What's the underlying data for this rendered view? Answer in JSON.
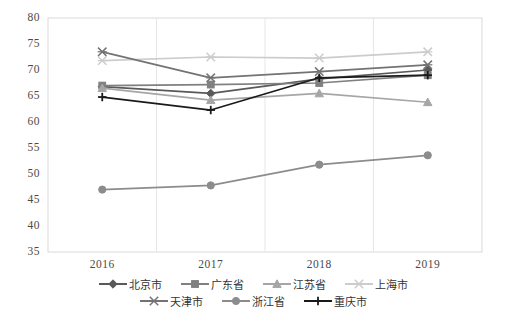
{
  "chart_data": {
    "type": "line",
    "title": "",
    "xlabel": "",
    "ylabel": "",
    "categories": [
      "2016",
      "2017",
      "2018",
      "2019"
    ],
    "ylim": [
      35,
      80
    ],
    "yticks": [
      35,
      40,
      45,
      50,
      55,
      60,
      65,
      70,
      75,
      80
    ],
    "grid": true,
    "grid_axis": "x",
    "legend_position": "bottom",
    "series": [
      {
        "name": "北京市",
        "marker": "diamond",
        "color": "#595959",
        "values": [
          66.8,
          65.5,
          68.3,
          70.0
        ]
      },
      {
        "name": "广东省",
        "marker": "square",
        "color": "#808080",
        "values": [
          67.0,
          67.2,
          67.5,
          69.0
        ]
      },
      {
        "name": "江苏省",
        "marker": "triangle",
        "color": "#a6a6a6",
        "values": [
          66.5,
          64.2,
          65.5,
          63.8
        ]
      },
      {
        "name": "上海市",
        "marker": "x",
        "color": "#cccccc",
        "values": [
          71.8,
          72.5,
          72.3,
          73.5
        ]
      },
      {
        "name": "天津市",
        "marker": "x",
        "color": "#737373",
        "values": [
          73.5,
          68.5,
          69.7,
          71.0
        ]
      },
      {
        "name": "浙江省",
        "marker": "circle",
        "color": "#8c8c8c",
        "values": [
          47.0,
          47.8,
          51.8,
          53.6
        ]
      },
      {
        "name": "重庆市",
        "marker": "plus",
        "color": "#1a1a1a",
        "values": [
          64.8,
          62.3,
          68.5,
          69.0
        ]
      }
    ]
  },
  "axes": {
    "y_tick_labels": [
      "80",
      "75",
      "70",
      "65",
      "60",
      "55",
      "50",
      "45",
      "40",
      "35"
    ],
    "x_tick_labels": [
      "2016",
      "2017",
      "2018",
      "2019"
    ]
  },
  "legend": {
    "row1": [
      "北京市",
      "广东省",
      "江苏省",
      "上海市"
    ],
    "row2": [
      "天津市",
      "浙江省",
      "重庆市"
    ]
  }
}
